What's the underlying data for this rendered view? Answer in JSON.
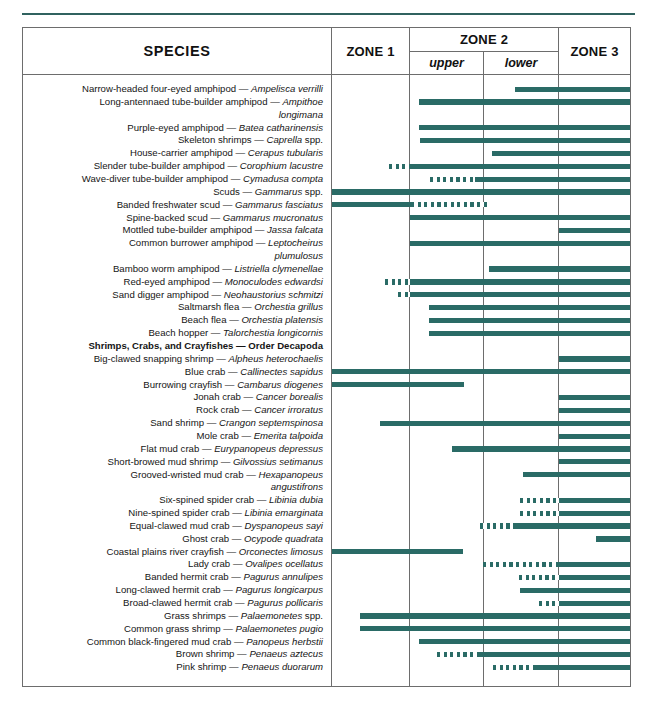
{
  "table": {
    "headers": {
      "species": "SPECIES",
      "zone1": "ZONE 1",
      "zone2": "ZONE 2",
      "zone2_upper": "upper",
      "zone2_lower": "lower",
      "zone3": "ZONE 3"
    },
    "colors": {
      "bar": "#2a6b66",
      "rule": "#6d6d6d",
      "top_rule": "#30625f"
    },
    "columns": [
      {
        "key": "species",
        "x": 0,
        "w": 308
      },
      {
        "key": "zone1",
        "x": 309,
        "w": 77
      },
      {
        "key": "upper",
        "x": 387,
        "w": 73
      },
      {
        "key": "lower",
        "x": 461,
        "w": 74
      },
      {
        "key": "zone3",
        "x": 536,
        "w": 71
      }
    ],
    "rows": [
      {
        "common": "Narrow-headed four-eyed amphipod",
        "sci": "Ampelisca verrilli",
        "dash_start": null,
        "solid_start": 492,
        "end": 607
      },
      {
        "common": "Long-antennaed tube-builder amphipod",
        "sci": "Ampithoe",
        "dash_start": null,
        "solid_start": 396,
        "end": 607
      },
      {
        "common": "",
        "sci": "longimana",
        "continuation": true,
        "dash_start": null,
        "solid_start": null,
        "end": null
      },
      {
        "common": "Purple-eyed amphipod",
        "sci": "Batea catharinensis",
        "dash_start": null,
        "solid_start": 396,
        "end": 607
      },
      {
        "common": "Skeleton shrimps",
        "sci": "Caprella",
        "suffix": " spp.",
        "dash_start": null,
        "solid_start": 397,
        "end": 607
      },
      {
        "common": "House-carrier amphipod",
        "sci": "Cerapus tubularis",
        "dash_start": null,
        "solid_start": 469,
        "end": 607
      },
      {
        "common": "Slender tube-builder amphipod",
        "sci": "Corophium lacustre",
        "dash_start": 366,
        "solid_start": 387,
        "end": 607
      },
      {
        "common": "Wave-diver tube-builder amphipod",
        "sci": "Cymadusa compta",
        "dash_start": 407,
        "solid_start": 452,
        "end": 607
      },
      {
        "common": "Scuds",
        "sci": "Gammarus",
        "suffix": " spp.",
        "dash_start": null,
        "solid_start": 309,
        "end": 607
      },
      {
        "common": "Banded freshwater scud",
        "sci": "Gammarus fasciatus",
        "dash_start": 388,
        "solid_start": 309,
        "dash_only_after": true,
        "end": 440
      },
      {
        "common": "Spine-backed scud",
        "sci": "Gammarus mucronatus",
        "dash_start": null,
        "solid_start": 387,
        "end": 607
      },
      {
        "common": "Mottled tube-builder amphipod",
        "sci": "Jassa falcata",
        "dash_start": null,
        "solid_start": 536,
        "end": 607
      },
      {
        "common": "Common burrower amphipod",
        "sci": "Leptocheirus",
        "dash_start": null,
        "solid_start": 387,
        "end": 607
      },
      {
        "common": "",
        "sci": "plumulosus",
        "continuation": true,
        "dash_start": null,
        "solid_start": null,
        "end": null
      },
      {
        "common": "Bamboo worm amphipod",
        "sci": "Listriella clymenellae",
        "dash_start": null,
        "solid_start": 466,
        "end": 607
      },
      {
        "common": "Red-eyed amphipod",
        "sci": "Monoculodes edwardsi",
        "dash_start": 362,
        "solid_start": 387,
        "end": 607
      },
      {
        "common": "Sand digger amphipod",
        "sci": "Neohaustorius schmitzi",
        "dash_start": 375,
        "solid_start": 387,
        "end": 607
      },
      {
        "common": "Saltmarsh flea",
        "sci": "Orchestia grillus",
        "dash_start": null,
        "solid_start": 406,
        "end": 607
      },
      {
        "common": "Beach flea",
        "sci": "Orchestia platensis",
        "dash_start": null,
        "solid_start": 406,
        "end": 607
      },
      {
        "common": "Beach hopper",
        "sci": "Talorchestia longicornis",
        "dash_start": null,
        "solid_start": 406,
        "end": 607
      },
      {
        "common": "Shrimps, Crabs, and Crayfishes — Order Decapoda",
        "sci": "",
        "heading": true,
        "dash_start": null,
        "solid_start": null,
        "end": null
      },
      {
        "common": "Big-clawed snapping shrimp",
        "sci": "Alpheus heterochaelis",
        "dash_start": null,
        "solid_start": 536,
        "end": 607
      },
      {
        "common": "Blue crab",
        "sci": "Callinectes sapidus",
        "dash_start": null,
        "solid_start": 309,
        "end": 607
      },
      {
        "common": "Burrowing crayfish",
        "sci": "Cambarus diogenes",
        "dash_start": null,
        "solid_start": 309,
        "end": 441
      },
      {
        "common": "Jonah crab",
        "sci": "Cancer borealis",
        "dash_start": null,
        "solid_start": 536,
        "end": 607
      },
      {
        "common": "Rock crab",
        "sci": "Cancer irroratus",
        "dash_start": null,
        "solid_start": 536,
        "end": 607
      },
      {
        "common": "Sand shrimp",
        "sci": "Crangon septemspinosa",
        "dash_start": null,
        "solid_start": 357,
        "end": 607
      },
      {
        "common": "Mole crab",
        "sci": "Emerita talpoida",
        "dash_start": null,
        "solid_start": 536,
        "end": 607
      },
      {
        "common": "Flat mud crab",
        "sci": "Eurypanopeus depressus",
        "dash_start": null,
        "solid_start": 429,
        "end": 607
      },
      {
        "common": "Short-browed mud shrimp",
        "sci": "Gilvossius setimanus",
        "dash_start": null,
        "solid_start": 536,
        "end": 607
      },
      {
        "common": "Grooved-wristed mud crab",
        "sci": "Hexapanopeus",
        "dash_start": null,
        "solid_start": 500,
        "end": 607
      },
      {
        "common": "",
        "sci": "angustifrons",
        "continuation": true,
        "dash_start": null,
        "solid_start": null,
        "end": null
      },
      {
        "common": "Six-spined spider crab",
        "sci": "Libinia dubia",
        "dash_start": 497,
        "solid_start": 536,
        "end": 607
      },
      {
        "common": "Nine-spined spider crab",
        "sci": "Libinia emarginata",
        "dash_start": 497,
        "solid_start": 536,
        "end": 607
      },
      {
        "common": "Equal-clawed mud crab",
        "sci": "Dyspanopeus sayi",
        "dash_start": 457,
        "solid_start": 490,
        "end": 607
      },
      {
        "common": "Ghost crab",
        "sci": "Ocypode quadrata",
        "dash_start": null,
        "solid_start": 573,
        "end": 607
      },
      {
        "common": "Coastal plains river crayfish",
        "sci": "Orconectes limosus",
        "dash_start": null,
        "solid_start": 309,
        "end": 440
      },
      {
        "common": "Lady crab",
        "sci": "Ovalipes ocellatus",
        "dash_start": 460,
        "solid_start": 536,
        "end": 607
      },
      {
        "common": "Banded hermit crab",
        "sci": "Pagurus annulipes",
        "dash_start": 496,
        "solid_start": 536,
        "end": 607
      },
      {
        "common": "Long-clawed hermit crab",
        "sci": "Pagurus longicarpus",
        "dash_start": null,
        "solid_start": 497,
        "end": 607
      },
      {
        "common": "Broad-clawed hermit crab",
        "sci": "Pagurus pollicaris",
        "dash_start": 516,
        "solid_start": 536,
        "end": 607
      },
      {
        "common": "Grass shrimps",
        "sci": "Palaemonetes",
        "suffix": " spp.",
        "dash_start": null,
        "solid_start": 337,
        "end": 607
      },
      {
        "common": "Common grass shrimp",
        "sci": "Palaemonetes pugio",
        "dash_start": null,
        "solid_start": 337,
        "end": 607
      },
      {
        "common": "Common black-fingered mud crab",
        "sci": "Panopeus herbstii",
        "dash_start": null,
        "solid_start": 396,
        "end": 607
      },
      {
        "common": "Brown shrimp",
        "sci": "Penaeus aztecus",
        "dash_start": 414,
        "solid_start": 455,
        "end": 607
      },
      {
        "common": "Pink shrimp",
        "sci": "Penaeus duorarum",
        "dash_start": 470,
        "solid_start": 510,
        "end": 607
      }
    ]
  }
}
